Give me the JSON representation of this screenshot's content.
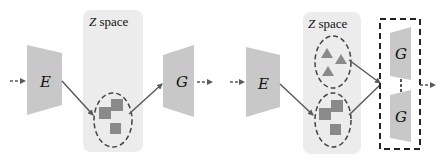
{
  "colors": {
    "block": "#c8c8c8",
    "zspace": "#ececec",
    "latent_marker": "#8a8a8a",
    "line": "#5a5a5a",
    "dashed": "#222222"
  },
  "left_panel": {
    "encoder_label": "E",
    "generator_label": "G",
    "zspace_label_italic": "Z",
    "zspace_label_rest": " space",
    "cluster": {
      "shape": "square",
      "count": 3
    }
  },
  "right_panel": {
    "encoder_label": "E",
    "generator_top_label": "G",
    "generator_bottom_label": "G",
    "zspace_label_italic": "Z",
    "zspace_label_rest": " space",
    "clusters": [
      {
        "shape": "triangle",
        "count": 3
      },
      {
        "shape": "square",
        "count": 3
      }
    ]
  }
}
